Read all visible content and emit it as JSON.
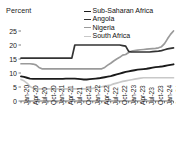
{
  "chart_data": {
    "type": "line",
    "title": "",
    "subtitle": "",
    "ylabel": "Percent",
    "xlabel": "",
    "ylim": [
      0,
      27
    ],
    "yticks": [
      0,
      5,
      10,
      15,
      20,
      25
    ],
    "grid": false,
    "legend_position": "top-right",
    "x": [
      "Jan-20",
      "Feb-20",
      "Mar-20",
      "Apr-20",
      "May-20",
      "Jun-20",
      "Jul-20",
      "Aug-20",
      "Sep-20",
      "Oct-20",
      "Nov-20",
      "Dec-20",
      "Jan-21",
      "Feb-21",
      "Mar-21",
      "Apr-21",
      "May-21",
      "Jun-21",
      "Jul-21",
      "Aug-21",
      "Sep-21",
      "Oct-21",
      "Nov-21",
      "Dec-21",
      "Jan-22",
      "Feb-22",
      "Mar-22",
      "Apr-22",
      "May-22",
      "Jun-22",
      "Jul-22",
      "Aug-22",
      "Sep-22",
      "Oct-22",
      "Nov-22",
      "Dec-22",
      "Jan-23",
      "Feb-23",
      "Mar-23",
      "Apr-23",
      "May-23",
      "Jun-23",
      "Jul-23",
      "Aug-23",
      "Sep-23",
      "Oct-23",
      "Nov-23",
      "Dec-23",
      "Jan-24",
      "Feb-24",
      "Mar-24",
      "Apr-24"
    ],
    "xticks": [
      "Jan-20",
      "Apr-20",
      "Jul-20",
      "Oct-20",
      "Jan-21",
      "Apr-21",
      "Jul-21",
      "Oct-21",
      "Jan-22",
      "Apr-22",
      "Jul-22",
      "Oct-22",
      "Jan-23",
      "Apr-23",
      "Jul-23",
      "Oct-23",
      "Jan-24",
      "Apr-24"
    ],
    "series": [
      {
        "name": "Sub-Saharan Africa",
        "color": "#1a1a1a",
        "width": 1.9,
        "values": [
          8.8,
          8.6,
          8.3,
          8.0,
          7.9,
          7.9,
          7.9,
          7.9,
          7.9,
          7.9,
          7.9,
          7.9,
          7.9,
          7.9,
          7.9,
          8.0,
          8.0,
          8.0,
          8.0,
          7.9,
          7.8,
          7.7,
          7.7,
          7.8,
          7.9,
          8.0,
          8.1,
          8.3,
          8.5,
          8.7,
          8.9,
          9.2,
          9.5,
          9.8,
          10.1,
          10.4,
          10.6,
          10.8,
          11.0,
          11.2,
          11.3,
          11.4,
          11.5,
          11.7,
          11.9,
          12.1,
          12.2,
          12.3,
          12.5,
          12.7,
          12.9,
          13.1
        ]
      },
      {
        "name": "Angola",
        "color": "#333333",
        "width": 1.7,
        "values": [
          15.3,
          15.3,
          15.3,
          15.3,
          15.3,
          15.3,
          15.3,
          15.3,
          15.3,
          15.3,
          15.3,
          15.3,
          15.3,
          15.3,
          15.3,
          15.3,
          15.3,
          15.3,
          20.0,
          20.0,
          20.0,
          20.0,
          20.0,
          20.0,
          20.0,
          20.0,
          20.0,
          20.0,
          20.0,
          20.0,
          20.0,
          20.0,
          20.0,
          20.0,
          19.8,
          19.6,
          17.7,
          17.5,
          17.5,
          17.5,
          17.5,
          17.5,
          17.5,
          17.5,
          17.6,
          17.7,
          17.8,
          18.0,
          18.3,
          18.6,
          18.8,
          19.0
        ]
      },
      {
        "name": "Nigeria",
        "color": "#9a9a9a",
        "width": 1.7,
        "values": [
          13.3,
          13.3,
          13.3,
          13.3,
          13.2,
          12.9,
          12.0,
          11.5,
          11.5,
          11.5,
          11.5,
          11.5,
          11.5,
          11.5,
          11.5,
          11.5,
          11.5,
          11.5,
          11.5,
          11.5,
          11.5,
          11.5,
          11.5,
          11.5,
          11.5,
          11.5,
          11.5,
          11.5,
          12.0,
          12.8,
          13.5,
          14.3,
          15.0,
          15.6,
          16.4,
          16.6,
          17.3,
          17.8,
          18.0,
          18.2,
          18.3,
          18.4,
          18.5,
          18.6,
          18.7,
          18.8,
          19.0,
          19.4,
          20.5,
          22.2,
          23.8,
          25.0
        ]
      },
      {
        "name": "South Africa",
        "color": "#c8c8c8",
        "width": 1.7,
        "values": [
          7.7,
          7.2,
          6.4,
          5.2,
          4.6,
          4.4,
          4.3,
          4.3,
          4.3,
          4.3,
          4.3,
          4.3,
          4.3,
          4.3,
          4.3,
          4.3,
          4.3,
          4.3,
          4.3,
          4.3,
          4.3,
          4.3,
          4.3,
          4.4,
          4.5,
          4.7,
          4.9,
          5.1,
          5.3,
          5.5,
          5.7,
          6.1,
          6.4,
          6.7,
          7.0,
          7.2,
          7.4,
          7.6,
          7.8,
          8.0,
          8.2,
          8.3,
          8.3,
          8.3,
          8.3,
          8.3,
          8.3,
          8.3,
          8.3,
          8.3,
          8.3,
          8.3
        ]
      }
    ]
  },
  "legend": {
    "items": [
      {
        "label": "Sub-Saharan Africa",
        "color": "#1a1a1a"
      },
      {
        "label": "Angola",
        "color": "#333333"
      },
      {
        "label": "Nigeria",
        "color": "#9a9a9a"
      },
      {
        "label": "South Africa",
        "color": "#c8c8c8"
      }
    ]
  },
  "axes": {
    "y_title": "Percent",
    "y_tick_labels": [
      "25",
      "20",
      "15",
      "10",
      "5",
      "0"
    ],
    "x_tick_labels": [
      "Jan-20",
      "Apr-20",
      "Jul-20",
      "Oct-20",
      "Jan-21",
      "Apr-21",
      "Jul-21",
      "Oct-21",
      "Jan-22",
      "Apr-22",
      "Jul-22",
      "Oct-22",
      "Jan-23",
      "Apr-23",
      "Jul-23",
      "Oct-23",
      "Jan-24",
      "Apr-24"
    ]
  },
  "style": {
    "axis_color": "#4a4a4a",
    "background": "#ffffff"
  }
}
